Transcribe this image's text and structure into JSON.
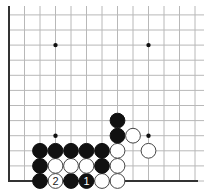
{
  "diagram": {
    "type": "go-board-fragment",
    "columns": 13,
    "rows": 12,
    "visible_edges": [
      "left",
      "bottom"
    ],
    "colors": {
      "grid": "#b8b8b8",
      "edge": "#333333",
      "black_stone": "#111111",
      "white_stone": "#ffffff"
    },
    "star_points": [
      {
        "col": 3,
        "row": 9
      },
      {
        "col": 9,
        "row": 9
      },
      {
        "col": 3,
        "row": 3
      },
      {
        "col": 9,
        "row": 3
      }
    ],
    "stones": [
      {
        "col": 2,
        "row": 0,
        "color": "black",
        "label": ""
      },
      {
        "col": 3,
        "row": 0,
        "color": "white",
        "label": "2"
      },
      {
        "col": 4,
        "row": 0,
        "color": "black",
        "label": ""
      },
      {
        "col": 5,
        "row": 0,
        "color": "black",
        "label": "1"
      },
      {
        "col": 6,
        "row": 0,
        "color": "white",
        "label": ""
      },
      {
        "col": 7,
        "row": 0,
        "color": "white",
        "label": ""
      },
      {
        "col": 2,
        "row": 1,
        "color": "black",
        "label": ""
      },
      {
        "col": 3,
        "row": 1,
        "color": "white",
        "label": ""
      },
      {
        "col": 4,
        "row": 1,
        "color": "white",
        "label": ""
      },
      {
        "col": 5,
        "row": 1,
        "color": "white",
        "label": ""
      },
      {
        "col": 6,
        "row": 1,
        "color": "black",
        "label": ""
      },
      {
        "col": 7,
        "row": 1,
        "color": "white",
        "label": ""
      },
      {
        "col": 2,
        "row": 2,
        "color": "black",
        "label": ""
      },
      {
        "col": 3,
        "row": 2,
        "color": "black",
        "label": ""
      },
      {
        "col": 4,
        "row": 2,
        "color": "black",
        "label": ""
      },
      {
        "col": 5,
        "row": 2,
        "color": "black",
        "label": ""
      },
      {
        "col": 6,
        "row": 2,
        "color": "black",
        "label": ""
      },
      {
        "col": 7,
        "row": 2,
        "color": "white",
        "label": ""
      },
      {
        "col": 9,
        "row": 2,
        "color": "white",
        "label": ""
      },
      {
        "col": 7,
        "row": 3,
        "color": "black",
        "label": ""
      },
      {
        "col": 8,
        "row": 3,
        "color": "white",
        "label": ""
      },
      {
        "col": 7,
        "row": 4,
        "color": "black",
        "label": ""
      }
    ],
    "move_labels": {
      "move_1": "1",
      "move_2": "2"
    }
  }
}
